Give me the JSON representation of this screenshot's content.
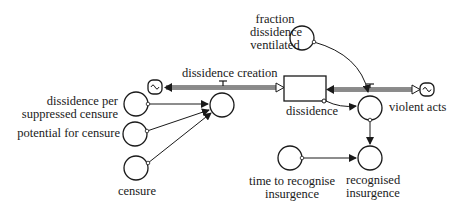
{
  "diagram": {
    "type": "stock-and-flow",
    "stocks": [
      {
        "id": "dissidence",
        "label": "dissidence"
      }
    ],
    "flows": [
      {
        "id": "dissidence_creation",
        "label": "dissidence creation"
      },
      {
        "id": "violent_acts",
        "label": "violent acts"
      }
    ],
    "variables": [
      {
        "id": "fraction_dissidence_ventilated",
        "label_lines": [
          "fraction",
          "dissidence",
          "ventilated"
        ]
      },
      {
        "id": "dissidence_per_suppressed_censure",
        "label_lines": [
          "dissidence per",
          "suppressed censure"
        ]
      },
      {
        "id": "potential_for_censure",
        "label": "potential for censure"
      },
      {
        "id": "censure",
        "label": "censure"
      },
      {
        "id": "time_to_recognise_insurgence",
        "label_lines": [
          "time to recognise",
          "insurgence"
        ]
      },
      {
        "id": "recognised_insurgence",
        "label_lines": [
          "recognised",
          "insurgence"
        ]
      }
    ],
    "links": [
      {
        "from": "dissidence_per_suppressed_censure",
        "to": "dissidence_creation"
      },
      {
        "from": "potential_for_censure",
        "to": "dissidence_creation"
      },
      {
        "from": "censure",
        "to": "dissidence_creation"
      },
      {
        "from": "fraction_dissidence_ventilated",
        "to": "violent_acts"
      },
      {
        "from": "dissidence",
        "to": "violent_acts"
      },
      {
        "from": "violent_acts",
        "to": "recognised_insurgence"
      },
      {
        "from": "time_to_recognise_insurgence",
        "to": "recognised_insurgence"
      }
    ]
  }
}
